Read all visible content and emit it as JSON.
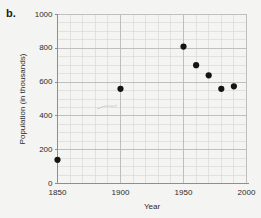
{
  "figure": {
    "panel_label": "b."
  },
  "chart_data": {
    "type": "scatter",
    "title": "",
    "xlabel": "Year",
    "ylabel": "Population (in thousands)",
    "xlim": [
      1850,
      2000
    ],
    "ylim": [
      0,
      1000
    ],
    "x_major_ticks": [
      1850,
      1900,
      1950,
      2000
    ],
    "x_tick_labels": [
      "1850",
      "1900",
      "1950",
      "2000"
    ],
    "x_minor_step": 10,
    "y_major_ticks": [
      0,
      200,
      400,
      600,
      800,
      1000
    ],
    "y_tick_labels": [
      "0",
      "200",
      "400",
      "600",
      "800",
      "1000"
    ],
    "y_minor_step": 50,
    "grid": true,
    "legend": "none",
    "x": [
      1850,
      1900,
      1950,
      1960,
      1970,
      1980,
      1990
    ],
    "y": [
      140,
      560,
      810,
      700,
      640,
      560,
      575
    ],
    "points": [
      {
        "x": 1850,
        "y": 140
      },
      {
        "x": 1900,
        "y": 560
      },
      {
        "x": 1950,
        "y": 810
      },
      {
        "x": 1960,
        "y": 700
      },
      {
        "x": 1970,
        "y": 640
      },
      {
        "x": 1980,
        "y": 560
      },
      {
        "x": 1990,
        "y": 575
      }
    ],
    "marker_color": "#141414",
    "grid_color": "#d8d8d8",
    "grid_major_color": "#b9b9bd",
    "axis_color": "#8d8d92"
  }
}
